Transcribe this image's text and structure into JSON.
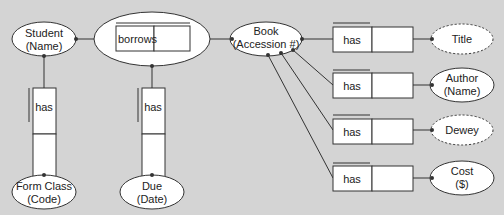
{
  "diagram": {
    "type": "ORM fact diagram",
    "entities": [
      {
        "id": "student",
        "line1": "Student",
        "line2": "(Name)",
        "style": "solid"
      },
      {
        "id": "book",
        "line1": "Book",
        "line2": "(Accession #)",
        "style": "solid"
      },
      {
        "id": "form_class",
        "line1": "Form Class",
        "line2": "(Code)",
        "style": "solid"
      },
      {
        "id": "due",
        "line1": "Due",
        "line2": "(Date)",
        "style": "solid"
      },
      {
        "id": "title",
        "line1": "Title",
        "style": "dashed"
      },
      {
        "id": "author",
        "line1": "Author",
        "line2": "(Name)",
        "style": "solid"
      },
      {
        "id": "dewey",
        "line1": "Dewey",
        "style": "dashed"
      },
      {
        "id": "cost",
        "line1": "Cost",
        "line2": "($)",
        "style": "solid"
      }
    ],
    "facts": [
      {
        "id": "borrows",
        "label": "borrows",
        "from": "student",
        "to": "book",
        "objectified": true
      },
      {
        "id": "student_has_form",
        "label": "has",
        "from": "student",
        "to": "form_class"
      },
      {
        "id": "borrows_has_due",
        "label": "has",
        "from": "borrows",
        "to": "due"
      },
      {
        "id": "book_has_title",
        "label": "has",
        "from": "book",
        "to": "title"
      },
      {
        "id": "book_has_author",
        "label": "has",
        "from": "book",
        "to": "author"
      },
      {
        "id": "book_has_dewey",
        "label": "has",
        "from": "book",
        "to": "dewey"
      },
      {
        "id": "book_has_cost",
        "label": "has",
        "from": "book",
        "to": "cost"
      }
    ]
  },
  "colors": {
    "background": "#d4d4d4",
    "shape_fill": "#ffffff",
    "stroke": "#333333"
  }
}
